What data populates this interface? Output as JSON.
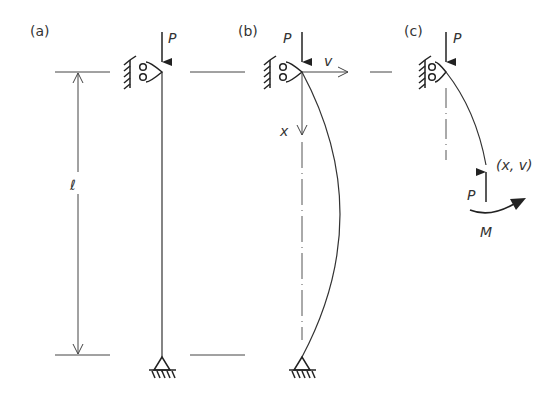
{
  "diagram": {
    "panels": [
      {
        "id": "a",
        "label": "(a)",
        "load_label": "P",
        "length_label": "ℓ"
      },
      {
        "id": "b",
        "label": "(b)",
        "load_label": "P",
        "axis_v": "v",
        "axis_x": "x"
      },
      {
        "id": "c",
        "label": "(c)",
        "load_label": "P",
        "point_label": "(x, v)",
        "reaction_label": "P",
        "moment_label": "M"
      }
    ],
    "colors": {
      "line": "#333333",
      "background": "#ffffff"
    }
  }
}
